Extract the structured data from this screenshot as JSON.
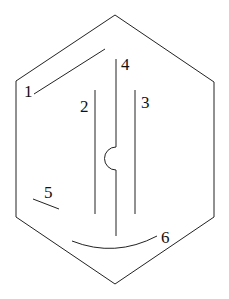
{
  "diagram": {
    "shape": "hexagon",
    "stroke_color": "#222222",
    "labels": [
      {
        "id": "1",
        "text": "1"
      },
      {
        "id": "2",
        "text": "2"
      },
      {
        "id": "3",
        "text": "3"
      },
      {
        "id": "4",
        "text": "4"
      },
      {
        "id": "5",
        "text": "5"
      },
      {
        "id": "6",
        "text": "6"
      }
    ]
  }
}
